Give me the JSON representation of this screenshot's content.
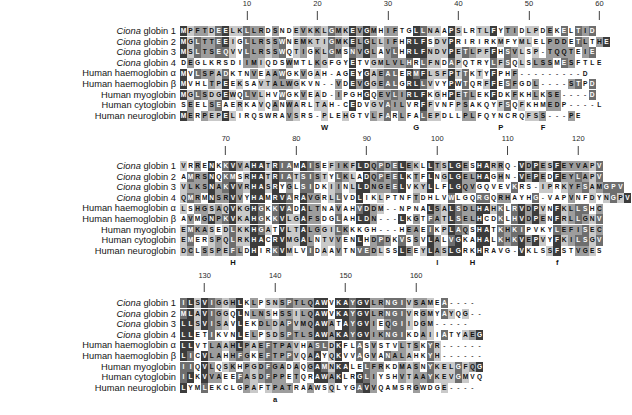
{
  "figure": {
    "alphabet": "amino-acid",
    "colors": {
      "shade_identical": "#3c3c3c",
      "shade_high": "#6e6e6e",
      "shade_medium": "#9d9d9d",
      "shade_low": "#c9c9c9",
      "background": "#ffffff",
      "text_dark": "#151515",
      "text_light": "#ffffff"
    },
    "gap_character": "-"
  },
  "labels": [
    {
      "genus": "Ciona",
      "rest": " globin 1",
      "italic_prefix": true
    },
    {
      "genus": "Ciona",
      "rest": " globin 2",
      "italic_prefix": true
    },
    {
      "genus": "Ciona",
      "rest": " globin 3",
      "italic_prefix": true
    },
    {
      "genus": "Ciona",
      "rest": " globin 4",
      "italic_prefix": true
    },
    {
      "genus": "",
      "rest": "Human haemoglobin α",
      "italic_prefix": false
    },
    {
      "genus": "",
      "rest": "Human haemoglobin β",
      "italic_prefix": false
    },
    {
      "genus": "",
      "rest": "Human myoglobin",
      "italic_prefix": false
    },
    {
      "genus": "",
      "rest": "Human cytoglobin",
      "italic_prefix": false
    },
    {
      "genus": "",
      "rest": "Human neuroglobin",
      "italic_prefix": false
    }
  ],
  "blocks": [
    {
      "id": "block-1",
      "range": [
        1,
        63
      ],
      "ruler_ticks": [
        {
          "label": "10",
          "col": 10
        },
        {
          "label": "20",
          "col": 20
        },
        {
          "label": "30",
          "col": 30
        },
        {
          "label": "40",
          "col": 40
        },
        {
          "label": "50",
          "col": 50
        },
        {
          "label": "60",
          "col": 60
        }
      ],
      "markers": [
        {
          "letter": "W",
          "col": 21
        },
        {
          "letter": "G",
          "col": 34
        },
        {
          "letter": "P",
          "col": 46
        },
        {
          "letter": "F",
          "col": 52
        }
      ],
      "sequences": [
        "MPFTDEELKLLRDSNDEVKKLGMKEVGMHIFTGLLNAAPSLRTLFYTIDLPDEKELTID",
        "MGLTTEEIGLLRSSWNEMKTIGMKELGLLIFHRLFSDVPRIRIRKMFYMLELPDDETLTHE",
        "MSLTSEQVVLLRSSWQTIGKLGMSNVGLAVLHRLFNDVPETLPFFHSVLSP-TQQTEIE",
        "DEGLKRSDIIMIQDSWMTLKGFGYETVGMLVLHRLFNDAPQTRYLFSQLSLSSMESFTLE",
        "MVLSPADKTNVEAAWGKVGAH-AGEYGAEALERMFLSFPTTKTYFPHF---------D",
        "MVHLTPEEKSAVTALWGKVN--VDEVGGEALGRLLVVYPWTQRFFESFGDL----STPD",
        "MGLSDGEWQLVLHVWGKVEAD-IPGHGQEVLIRLFKGHPETLEKFDKFKHLKSE----D",
        "SEELSEAERKAVQANWARLTAH-CEDVGVAILVRFFVNFPSAKQYFSQFKHMEDP----L",
        "MERPEPELIRQSWRAVSRS-PLEHGTVLFARLFALEPDLLPLFQYNCRQFSS---PE"
      ]
    },
    {
      "id": "block-2",
      "range": [
        64,
        126
      ],
      "ruler_ticks": [
        {
          "label": "70",
          "col": 70
        },
        {
          "label": "80",
          "col": 80
        },
        {
          "label": "90",
          "col": 90
        },
        {
          "label": "100",
          "col": 100
        },
        {
          "label": "110",
          "col": 110
        },
        {
          "label": "120",
          "col": 120
        }
      ],
      "markers": [
        {
          "letter": "H",
          "col": 71
        },
        {
          "letter": "l",
          "col": 100
        },
        {
          "letter": "H",
          "col": 105
        },
        {
          "letter": "f",
          "col": 117
        }
      ],
      "sequences": [
        "VRRENKKVVAHATRIAMAISEFIKFLDQPDELEKLLTSLGESHARRQ-VDPESFEYVAPV",
        "AMRSNQKMSRHATRIATSISTYLKLADQPEELKTFLNGLGELHAGHN-VEPEDFEYLAPV",
        "VLKSNAKVVRHASRYGLSIDKIINLLDNGEELVKYLLFLGQVGQVEVKRS-IPRKYFSAMGPV",
        "QMRMNSRVVYHAMRVARAVGRLLVDLIKLPTNFTDHLVWLGQRGQRHAYHG-VAPVNFDYNGPV",
        "LSHGSAQVKGHGKKVADALTNAVAHVDDM--NPNALSALSDLHAHKLRVDPVNFKLLSHC",
        "AVMGNPKVKAHGKKVLGAFSDGLAHLDN---LKGTFATLSELHCDKLHVDPENFRLLGNV",
        "EMKASEDLKKHGATVLTALGGILKKKGH---HEAEIKPLAQSHATKHKIPVKYLEFISEC",
        "EMERSPQLRKHACRVMGALNTVVENLHDPDKVSSVLALVGKAHALKHKVEPVYFKILSGV",
        "DCLSSPEFLDHIRKVMLVIDAAVTNVEDLSSLEEYLASLGRKHRAVG-VKLSSFSTVGES"
      ]
    },
    {
      "id": "block-3",
      "range": [
        127,
        166
      ],
      "ruler_ticks": [
        {
          "label": "130",
          "col": 130
        },
        {
          "label": "140",
          "col": 140
        },
        {
          "label": "150",
          "col": 150
        },
        {
          "label": "160",
          "col": 160
        }
      ],
      "markers": [
        {
          "letter": "a",
          "col": 140
        }
      ],
      "sequences": [
        "ILSVIGGHLKLPSNSPTLQAWVKAYGVLRNGIVSAMEA----",
        "MLAVIGGQLNLNSHSSILQAWVKAYGVLRNGIVRGMYAYQG--",
        "LLSVISAVLEKDLDAPVMQAWATAYGVIEQGIIDGM-----",
        "LLETIKVNLELPSDSPTLSAWAKAYGVIKNGIKDAIIATYAEG",
        "LLVTLAAHLPAEFTPAVHASLDKFLASVSTVLTSKYR------",
        "LICVLAHHFGKEFTPPVQAAYQKVVAGVANALAHKYH------",
        "IIQVLQSKHPGDFGADAQGAMNKALELFRKDMASNYKELGFQG",
        "ILKVVAEEFASDFPPETQRAWAKLRGLIYSHVTAAYKEVGMVQ",
        "LYMLEKCLGPAFTPATRAAWSQLYGAVVQAMSRGWDGE----"
      ]
    }
  ]
}
